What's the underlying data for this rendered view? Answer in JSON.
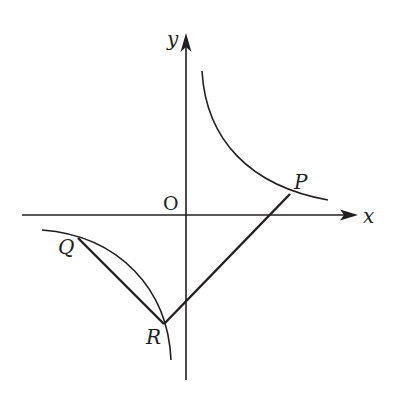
{
  "figure": {
    "type": "coordinate-geometry-diagram",
    "colors": {
      "stroke": "#231f20",
      "background": "#ffffff"
    },
    "axes": {
      "x_label": "x",
      "y_label": "y",
      "origin_label": "O"
    },
    "points": [
      {
        "name": "P",
        "label": "P",
        "branch": "upper-right"
      },
      {
        "name": "Q",
        "label": "Q",
        "branch": "lower-left"
      },
      {
        "name": "R",
        "label": "R",
        "branch": "lower-left"
      }
    ],
    "segments": [
      {
        "from": "Q",
        "to": "R"
      },
      {
        "from": "R",
        "to": "P"
      }
    ],
    "curves": [
      {
        "name": "hyperbola-branch-upper"
      },
      {
        "name": "hyperbola-branch-lower"
      }
    ]
  }
}
